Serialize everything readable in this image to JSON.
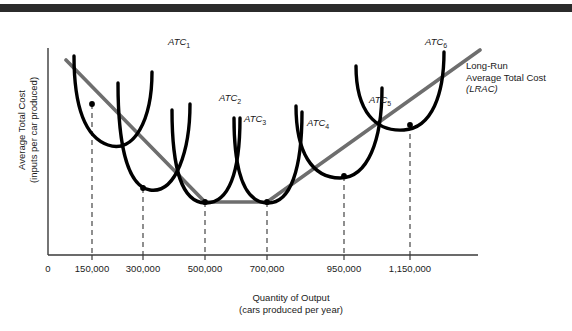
{
  "chart_data": {
    "type": "line",
    "title": "",
    "xlabel": "Quantity of Output\n(cars produced per year)",
    "ylabel": "Average Total Cost\n(inputs per car produced)",
    "x_ticks": [
      "0",
      "150,000",
      "300,000",
      "500,000",
      "700,000",
      "950,000",
      "1,150,000"
    ],
    "x_tick_px": [
      48,
      92,
      143,
      205,
      267,
      344,
      410
    ],
    "y_ticks": [],
    "grid": false,
    "legend_position": "inline-annotations",
    "xlim": [
      0,
      1350000
    ],
    "series": [
      {
        "name": "ATC1",
        "label": "ATC",
        "subscript": "1",
        "color": "#000000",
        "label_px": [
          168,
          36
        ],
        "min_x": 150000,
        "tangent_px": [
          92,
          104
        ],
        "path": "M 74,56 C 74,100 82,136 108,145 C 134,154 152,120 152,72"
      },
      {
        "name": "ATC2",
        "label": "ATC",
        "subscript": "2",
        "color": "#000000",
        "label_px": [
          219,
          92
        ],
        "min_x": 300000,
        "tangent_px": [
          143,
          188
        ],
        "path": "M 118,83 C 118,140 126,186 150,190 C 176,194 190,150 190,104"
      },
      {
        "name": "ATC3",
        "label": "ATC",
        "subscript": "3",
        "color": "#000000",
        "label_px": [
          244,
          113
        ],
        "min_x": 500000,
        "tangent_px": [
          205,
          202
        ],
        "path": "M 172,110 C 172,170 182,202 205,203 C 229,204 240,172 240,118"
      },
      {
        "name": "ATC4",
        "label": "ATC",
        "subscript": "4",
        "color": "#000000",
        "label_px": [
          307,
          117
        ],
        "min_x": 700000,
        "tangent_px": [
          267,
          202
        ],
        "path": "M 234,118 C 234,172 244,202 267,203 C 291,204 302,168 302,112"
      },
      {
        "name": "ATC5",
        "label": "ATC",
        "subscript": "5",
        "color": "#000000",
        "label_px": [
          369,
          94
        ],
        "min_x": 950000,
        "tangent_px": [
          344,
          176
        ],
        "path": "M 296,106 C 296,152 312,178 340,178 C 368,178 382,140 382,88"
      },
      {
        "name": "ATC6",
        "label": "ATC",
        "subscript": "6",
        "color": "#000000",
        "label_px": [
          425,
          36
        ],
        "min_x": 1150000,
        "tangent_px": [
          410,
          125
        ],
        "path": "M 356,66 C 356,112 376,132 404,130 C 432,128 444,94 444,52"
      }
    ],
    "envelope": {
      "name": "LRAC",
      "label": "Long-Run\nAverage Total Cost\n(LRAC)",
      "label_px": [
        466,
        60
      ],
      "color": "#6e6e6e",
      "path": "M 66,60 L 205,202 L 267,202 L 480,50",
      "flat_from_x": 500000,
      "flat_to_x": 700000
    },
    "tangency_points": [
      {
        "x_label": "150,000",
        "px": [
          92,
          104
        ]
      },
      {
        "x_label": "300,000",
        "px": [
          143,
          188
        ]
      },
      {
        "x_label": "500,000",
        "px": [
          205,
          202
        ]
      },
      {
        "x_label": "700,000",
        "px": [
          267,
          202
        ]
      },
      {
        "x_label": "950,000",
        "px": [
          344,
          176
        ]
      },
      {
        "x_label": "1,150,000",
        "px": [
          410,
          125
        ]
      }
    ],
    "dashed_drop_lines": [
      {
        "x_px": 92,
        "y_top": 104
      },
      {
        "x_px": 143,
        "y_top": 188
      },
      {
        "x_px": 205,
        "y_top": 202
      },
      {
        "x_px": 267,
        "y_top": 202
      },
      {
        "x_px": 344,
        "y_top": 176
      },
      {
        "x_px": 410,
        "y_top": 125
      }
    ]
  },
  "axis": {
    "y_axis_px": 48,
    "baseline_px": 255,
    "top_px": 48,
    "right_px": 478
  },
  "colors": {
    "curve": "#000000",
    "envelope": "#6e6e6e",
    "axis": "#3a3a3a",
    "topbar": "#2b2b2b",
    "text": "#1a1a1a"
  }
}
